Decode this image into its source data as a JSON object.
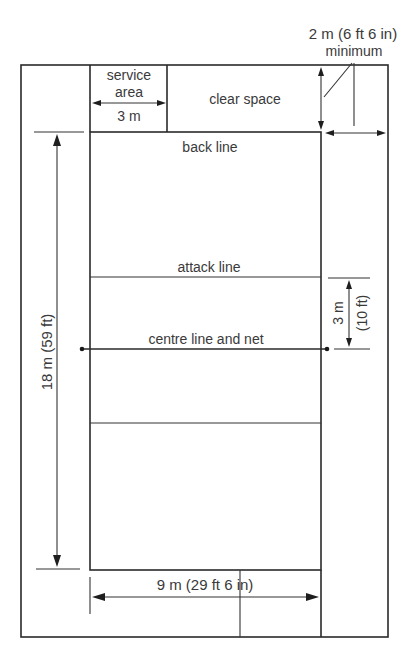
{
  "diagram": {
    "colors": {
      "line": "#2a2a2a",
      "text": "#3a3a3a",
      "background": "#ffffff"
    },
    "labels": {
      "free_zone_width": "2 m (6 ft 6 in)",
      "free_zone_qualifier": "minimum",
      "service_area_line1": "service",
      "service_area_line2": "area",
      "service_area_width": "3 m",
      "clear_space": "clear space",
      "back_line": "back line",
      "attack_line": "attack line",
      "centre_line": "centre line and net",
      "attack_zone_depth_m": "3 m",
      "attack_zone_depth_ft": "(10 ft)",
      "court_length": "18 m (59 ft)",
      "court_width": "9 m (29 ft 6 in)"
    },
    "measurements": {
      "court_length_m": 18,
      "court_width_m": 9,
      "attack_zone_depth_m": 3,
      "service_area_width_m": 3,
      "free_zone_min_m": 2
    }
  }
}
